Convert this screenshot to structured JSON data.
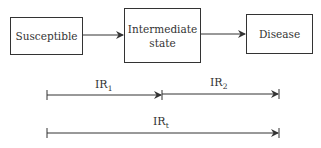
{
  "nodes": [
    {
      "id": "susceptible",
      "label": "Susceptible"
    },
    {
      "id": "intermediate",
      "label_line1": "Intermediate",
      "label_line2": "state"
    },
    {
      "id": "disease",
      "label": "Disease"
    }
  ],
  "edges": [
    {
      "from": "susceptible",
      "to": "intermediate"
    },
    {
      "from": "intermediate",
      "to": "disease"
    }
  ],
  "intervals": [
    {
      "name": "IR",
      "subscript": "1",
      "from": "susceptible",
      "to": "intermediate"
    },
    {
      "name": "IR",
      "subscript": "2",
      "from": "intermediate",
      "to": "disease"
    },
    {
      "name": "IR",
      "subscript": "t",
      "from": "susceptible",
      "to": "disease"
    }
  ]
}
